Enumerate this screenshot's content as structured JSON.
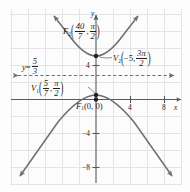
{
  "figure": {
    "type": "polar-conic-graph",
    "axes": {
      "x_axis_label": "x",
      "y_axis_label": "y",
      "x_ticks": [
        {
          "value": 4,
          "label": "4"
        },
        {
          "value": 8,
          "label": "8"
        }
      ],
      "y_ticks": [
        {
          "value": 4,
          "label": "4"
        },
        {
          "value": -4,
          "label": "−4"
        },
        {
          "value": -8,
          "label": "−8"
        }
      ],
      "x_range": [
        -10,
        10
      ],
      "y_range": [
        -11,
        11
      ],
      "grid": true,
      "grid_step": 2
    },
    "asymptote": {
      "label_y": "y",
      "label_eq": "=",
      "numerator": "5",
      "denominator": "3",
      "value": 1.6667,
      "style": "dashed",
      "arrows": "both"
    },
    "points": [
      {
        "name": "F2",
        "base": "F",
        "sub": "2",
        "numerator": "40",
        "denominator": "7",
        "angle_num": "π",
        "angle_den": "2",
        "comma": ","
      },
      {
        "name": "V2",
        "base": "V",
        "sub": "2",
        "first": "−5",
        "angle_num": "3π",
        "angle_den": "2",
        "comma": ","
      },
      {
        "name": "V1",
        "base": "V",
        "sub": "1",
        "numerator": "5",
        "denominator": "7",
        "angle_num": "π",
        "angle_den": "2",
        "comma": ","
      },
      {
        "name": "F1",
        "base": "F",
        "sub": "1",
        "text": "(0, 0)"
      }
    ],
    "colors": {
      "curve": "#6d6e71",
      "axis": "#58595b",
      "grid": "#e3e3e6",
      "asymptote": "#6d6e71",
      "text": "#231f20"
    }
  }
}
